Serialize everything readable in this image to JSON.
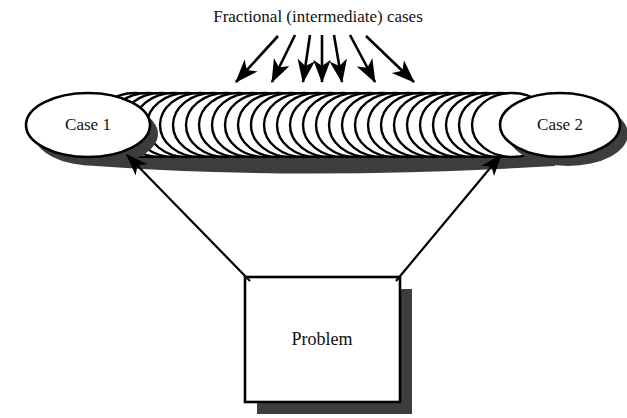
{
  "diagram": {
    "title": "Fractional (intermediate) cases",
    "type": "concept-diagram",
    "background_color": "#ffffff",
    "stroke_color": "#000000",
    "shadow_color": "#3d3d3d",
    "fill_color": "#ffffff",
    "nodes": [
      {
        "id": "case-1",
        "label": "Case 1",
        "shape": "ellipse",
        "cx": 88,
        "cy": 125,
        "rx": 62,
        "ry": 32
      },
      {
        "id": "case-2",
        "label": "Case 2",
        "shape": "ellipse",
        "cx": 560,
        "cy": 125,
        "rx": 60,
        "ry": 32
      },
      {
        "id": "problem",
        "label": "Problem",
        "shape": "rectangle",
        "x": 245,
        "y": 277,
        "width": 155,
        "height": 125
      }
    ],
    "stack": {
      "name": "fractional-cases-stack",
      "count": 30,
      "start_x": 135,
      "end_x": 515,
      "cy": 125,
      "rx": 40,
      "ry": 32,
      "shadow_offset_x": 8,
      "shadow_offset_y": 9
    },
    "fan_arrows": {
      "name": "title-fan-arrows",
      "count": 7,
      "origin_y": 33,
      "tail_x_start": 253,
      "tail_x_end": 357,
      "head_y": 86,
      "head_x_start": 232,
      "head_x_end": 418
    },
    "problem_arrows": [
      {
        "id": "problem-to-case-1",
        "from_x": 250,
        "from_y": 280,
        "to_x": 128,
        "to_y": 156
      },
      {
        "id": "problem-to-case-2",
        "from_x": 396,
        "from_y": 280,
        "to_x": 500,
        "to_y": 156
      }
    ]
  }
}
